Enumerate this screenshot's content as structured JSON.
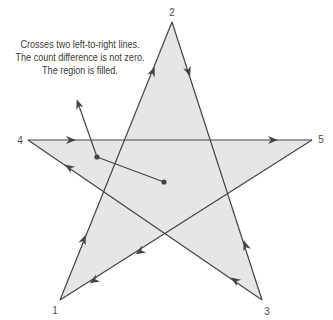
{
  "diagram": {
    "fill_color": "#e6e6e6",
    "stroke_color": "#444444",
    "caption": {
      "lines": [
        "Crosses two left-to-right lines.",
        "The count difference is not zero.",
        "The region is filled."
      ]
    },
    "vertices": [
      {
        "label": "1",
        "x": 60,
        "y": 300,
        "label_x": 55,
        "label_y": 310
      },
      {
        "label": "2",
        "x": 172,
        "y": 22,
        "label_x": 172,
        "label_y": 12
      },
      {
        "label": "3",
        "x": 262,
        "y": 300,
        "label_x": 267,
        "label_y": 311
      },
      {
        "label": "4",
        "x": 28,
        "y": 140,
        "label_x": 20,
        "label_y": 140
      },
      {
        "label": "5",
        "x": 312,
        "y": 140,
        "label_x": 321,
        "label_y": 139
      }
    ],
    "path_order": [
      "1",
      "2",
      "3",
      "4",
      "5",
      "1"
    ],
    "probe": {
      "start": {
        "x": 164,
        "y": 182
      },
      "bend": {
        "x": 97,
        "y": 157
      },
      "end": {
        "x": 76,
        "y": 98
      }
    }
  }
}
